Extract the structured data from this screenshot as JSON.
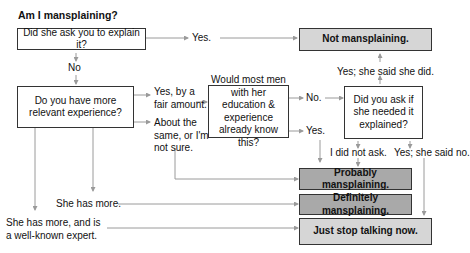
{
  "title": "Am I mansplaining?",
  "nodes": {
    "q1": "Did she ask you to explain it?",
    "q2": "Do you have more relevant experience?",
    "q3": "Would most men with her education & experience already know this?",
    "q4": "Did you ask if she needed it explained?"
  },
  "outcomes": {
    "not": "Not mansplaining.",
    "probably": "Probably mansplaining.",
    "definitely": "Definitely mansplaining.",
    "stop": "Just stop talking now."
  },
  "edges": {
    "q1_yes": "Yes.",
    "q1_no": "No",
    "q2_yes_fair": "Yes, by a fair amount.",
    "q2_same": "About the same, or I'm not sure.",
    "q2_she_more": "She has more.",
    "q2_she_expert": "She has more, and is a well-known expert.",
    "q3_no": "No.",
    "q3_yes": "Yes.",
    "q4_yes_did": "Yes; she said she did.",
    "q4_not_ask": "I did not ask.",
    "q4_yes_no": "Yes; she said no."
  },
  "colors": {
    "outcome_light": "#d6d6d6",
    "outcome_dark": "#a9a9a9",
    "line": "#9a9a9a",
    "border": "#333333"
  }
}
